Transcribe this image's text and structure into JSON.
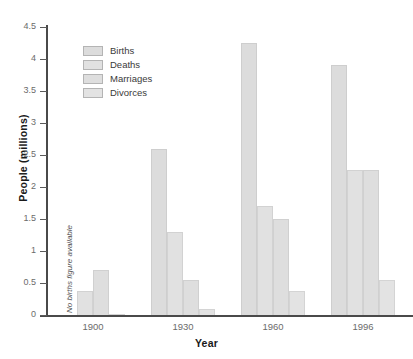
{
  "chart_data": {
    "type": "bar",
    "title": "",
    "xlabel": "Year",
    "ylabel": "People (millions)",
    "categories": [
      "1900",
      "1930",
      "1960",
      "1996"
    ],
    "series": [
      {
        "name": "Births",
        "values": [
          null,
          2.6,
          4.25,
          3.9
        ]
      },
      {
        "name": "Deaths",
        "values": [
          0.38,
          1.3,
          1.7,
          2.27
        ]
      },
      {
        "name": "Marriages",
        "values": [
          0.7,
          0.55,
          1.5,
          2.27
        ]
      },
      {
        "name": "Divorces",
        "values": [
          0.02,
          0.1,
          0.37,
          0.55
        ]
      }
    ],
    "ylim": [
      0,
      4.5
    ],
    "ytick_labels": [
      "0",
      "0.5",
      "1",
      "1.5",
      "2",
      "2.5",
      "3",
      "3.5",
      "4",
      "4.5"
    ],
    "ytick_values": [
      0,
      0.5,
      1,
      1.5,
      2,
      2.5,
      3,
      3.5,
      4,
      4.5
    ],
    "grid": false,
    "legend_position": "upper-left-inside",
    "annotations": [
      {
        "text": "No births figure available",
        "category": "1900",
        "series": "Births",
        "orientation": "vertical"
      }
    ],
    "colors": {
      "bar_fill": "#dedede",
      "bar_border": "#cfcfcf",
      "axis": "#4a4a4a",
      "tick_label": "#6b6b6b",
      "axis_title": "#1a1a1a",
      "background": "#ffffff"
    }
  }
}
